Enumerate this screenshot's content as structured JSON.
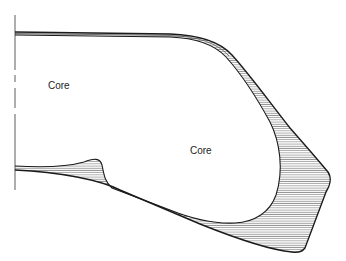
{
  "diagram": {
    "labels": [
      {
        "text": "Core",
        "x": 48,
        "y": 80
      },
      {
        "text": "Core",
        "x": 190,
        "y": 145
      }
    ],
    "colors": {
      "stroke": "#1a1a1a",
      "hatch": "#555555",
      "background": "#ffffff"
    }
  }
}
